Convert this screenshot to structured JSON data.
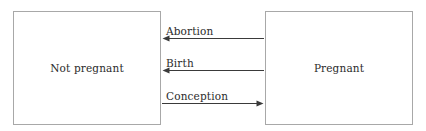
{
  "diagram": {
    "type": "state-transition",
    "background_color": "#ffffff",
    "line_color": "#3a3a3a",
    "box_border_color": "#a8a8a8",
    "text_color": "#2b2b2b",
    "states": [
      {
        "id": "not-pregnant",
        "label": "Not pregnant"
      },
      {
        "id": "pregnant",
        "label": "Pregnant"
      }
    ],
    "transitions": [
      {
        "id": "abortion",
        "label": "Abortion",
        "from": "Pregnant",
        "to": "Not pregnant",
        "direction": "left"
      },
      {
        "id": "birth",
        "label": "Birth",
        "from": "Pregnant",
        "to": "Not pregnant",
        "direction": "left"
      },
      {
        "id": "conception",
        "label": "Conception",
        "from": "Not pregnant",
        "to": "Pregnant",
        "direction": "right"
      }
    ]
  }
}
